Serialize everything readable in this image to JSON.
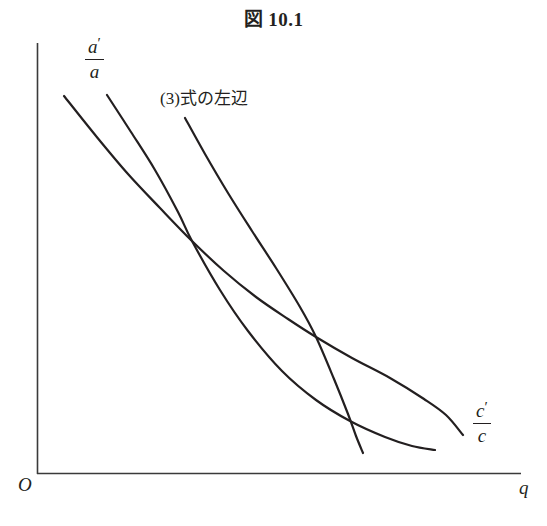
{
  "figure": {
    "title": "図 10.1",
    "background_color": "#ffffff",
    "ink_color": "#231f20"
  },
  "axes": {
    "origin_label": "O",
    "x_axis_label": "q",
    "y_axis_label": "",
    "x_range_px": [
      37,
      521
    ],
    "y_range_px": [
      43,
      474
    ],
    "show_ticks": false,
    "show_grid": false
  },
  "labels": {
    "curve_a": {
      "numerator": "a",
      "numerator_prime": "′",
      "denominator": "a",
      "text": "a′/a"
    },
    "curve_eq3": {
      "text": "(3)式の左辺"
    },
    "curve_c": {
      "numerator": "c",
      "numerator_prime": "′",
      "denominator": "c",
      "text": "c′/c"
    }
  },
  "chart_data": {
    "type": "line",
    "title": "図 10.1",
    "xlabel": "q",
    "ylabel": "",
    "grid": false,
    "legend": "inline-annotations",
    "axis_origin_label": "O",
    "xlim": [
      37,
      521
    ],
    "ylim": [
      474,
      43
    ],
    "note": "Three downward-sloping convex curves in pixel coordinates (y grows downward). They cross at two points.",
    "intersections": [
      {
        "x": 192,
        "y": 241
      },
      {
        "x": 316,
        "y": 337
      }
    ],
    "series": [
      {
        "name": "c′/c",
        "label": "c′/c",
        "label_position": {
          "x": 473,
          "y": 400
        },
        "stroke_width": 2.2,
        "points": [
          [
            64,
            96
          ],
          [
            96,
            136
          ],
          [
            128,
            174
          ],
          [
            160,
            208
          ],
          [
            192,
            241
          ],
          [
            224,
            271
          ],
          [
            256,
            297
          ],
          [
            288,
            319
          ],
          [
            316,
            337
          ],
          [
            352,
            358
          ],
          [
            390,
            378
          ],
          [
            424,
            399
          ],
          [
            446,
            415
          ],
          [
            463,
            435
          ]
        ]
      },
      {
        "name": "a′/a",
        "label": "a′/a",
        "label_position": {
          "x": 85,
          "y": 36
        },
        "stroke_width": 2.2,
        "points": [
          [
            107,
            95
          ],
          [
            131,
            132
          ],
          [
            155,
            170
          ],
          [
            178,
            212
          ],
          [
            192,
            241
          ],
          [
            220,
            290
          ],
          [
            248,
            331
          ],
          [
            282,
            371
          ],
          [
            316,
            400
          ],
          [
            350,
            421
          ],
          [
            385,
            437
          ],
          [
            412,
            446
          ],
          [
            435,
            450
          ]
        ]
      },
      {
        "name": "(3)式の左辺",
        "label": "(3)式の左辺",
        "label_position": {
          "x": 160,
          "y": 84
        },
        "stroke_width": 2.2,
        "points": [
          [
            185,
            118
          ],
          [
            205,
            154
          ],
          [
            228,
            193
          ],
          [
            252,
            231
          ],
          [
            276,
            268
          ],
          [
            300,
            307
          ],
          [
            316,
            337
          ],
          [
            334,
            379
          ],
          [
            348,
            414
          ],
          [
            356,
            436
          ],
          [
            363,
            453
          ]
        ]
      }
    ]
  }
}
